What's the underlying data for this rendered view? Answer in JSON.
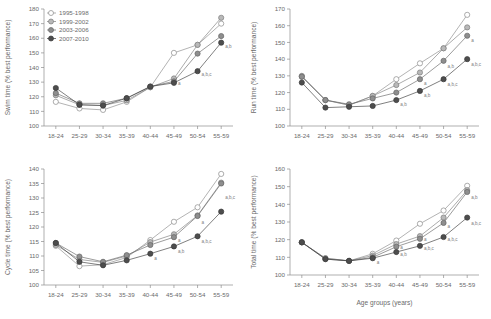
{
  "figure": {
    "legend": {
      "entries": [
        {
          "label": "1995-1998",
          "marker": "open-circle",
          "color": "#ffffff",
          "stroke": "#8a8a8a"
        },
        {
          "label": "1999-2002",
          "marker": "filled-circle",
          "color": "#b9b9b9",
          "stroke": "#7d7d7d"
        },
        {
          "label": "2003-2006",
          "marker": "filled-circle",
          "color": "#8e8e8e",
          "stroke": "#666666"
        },
        {
          "label": "2007-2010",
          "marker": "filled-circle",
          "color": "#4d4d4d",
          "stroke": "#3b3b3b"
        }
      ]
    },
    "xlabel_shared": "Age groups (years)"
  },
  "chart_data": [
    {
      "type": "line",
      "panel": "top-left",
      "title": "",
      "ylabel": "Swim time (% best performance)",
      "xlabel": "",
      "categories": [
        "18-24",
        "25-29",
        "30-34",
        "35-39",
        "40-44",
        "45-49",
        "50-54",
        "55-59"
      ],
      "ylim": [
        100,
        180
      ],
      "yticks": [
        100,
        110,
        120,
        130,
        140,
        150,
        160,
        170,
        180
      ],
      "grid": false,
      "legend_position": "top-left",
      "series": [
        {
          "name": "1995-1998",
          "values": [
            116.5,
            112.0,
            111.0,
            116.5,
            126.5,
            150.0,
            155.5,
            170.0
          ]
        },
        {
          "name": "1999-2002",
          "values": [
            121.0,
            114.5,
            114.0,
            117.5,
            126.5,
            132.5,
            155.5,
            174.0
          ]
        },
        {
          "name": "2003-2006",
          "values": [
            122.5,
            115.5,
            115.5,
            119.0,
            127.0,
            130.5,
            149.5,
            161.5
          ]
        },
        {
          "name": "2007-2010",
          "values": [
            126.0,
            114.5,
            114.0,
            119.0,
            127.0,
            129.5,
            137.5,
            157.0
          ]
        }
      ],
      "annotations": [
        {
          "x": "45-49",
          "y": 128.0,
          "text": "a"
        },
        {
          "x": "50-54",
          "y": 134.0,
          "text": "a,b,c"
        },
        {
          "x": "55-59",
          "y": 153.0,
          "text": "a,b"
        }
      ]
    },
    {
      "type": "line",
      "panel": "top-right",
      "title": "",
      "ylabel": "Run time (% best performance)",
      "xlabel": "",
      "categories": [
        "18-24",
        "25-29",
        "30-34",
        "35-39",
        "40-44",
        "45-49",
        "50-54",
        "55-59"
      ],
      "ylim": [
        100,
        170
      ],
      "yticks": [
        100,
        110,
        120,
        130,
        140,
        150,
        160,
        170
      ],
      "grid": false,
      "legend_position": "none",
      "series": [
        {
          "name": "1995-1998",
          "values": [
            129.5,
            115.5,
            112.5,
            118.0,
            128.0,
            137.5,
            146.5,
            166.5
          ]
        },
        {
          "name": "1999-2002",
          "values": [
            130.0,
            115.5,
            112.5,
            118.0,
            124.5,
            132.0,
            146.5,
            159.0
          ]
        },
        {
          "name": "2003-2006",
          "values": [
            129.5,
            115.5,
            113.0,
            116.5,
            120.0,
            128.0,
            139.0,
            154.0
          ]
        },
        {
          "name": "2007-2010",
          "values": [
            126.0,
            111.0,
            111.5,
            112.0,
            115.5,
            121.0,
            128.0,
            140.0
          ]
        }
      ],
      "annotations": [
        {
          "x": "40-44",
          "y": 112.0,
          "text": "a,b"
        },
        {
          "x": "45-49",
          "y": 117.5,
          "text": "a,b"
        },
        {
          "x": "45-49",
          "y": 124.5,
          "text": "a"
        },
        {
          "x": "50-54",
          "y": 124.0,
          "text": "a,b,c"
        },
        {
          "x": "50-54",
          "y": 135.0,
          "text": "a,b"
        },
        {
          "x": "55-59",
          "y": 136.0,
          "text": "a,b,c"
        },
        {
          "x": "55-59",
          "y": 150.0,
          "text": "a"
        }
      ]
    },
    {
      "type": "line",
      "panel": "bottom-left",
      "title": "",
      "ylabel": "Cycle time (% best performance)",
      "xlabel": "",
      "categories": [
        "18-24",
        "25-29",
        "30-34",
        "35-39",
        "40-44",
        "45-49",
        "50-54",
        "55-59"
      ],
      "ylim": [
        100,
        140
      ],
      "yticks": [
        100,
        105,
        110,
        115,
        120,
        125,
        130,
        135,
        140
      ],
      "grid": false,
      "legend_position": "none",
      "series": [
        {
          "name": "1995-1998",
          "values": [
            113.5,
            106.5,
            107.0,
            109.5,
            115.5,
            121.8,
            126.8,
            138.3
          ]
        },
        {
          "name": "1999-2002",
          "values": [
            113.8,
            108.8,
            107.8,
            110.0,
            114.8,
            117.5,
            124.0,
            135.3
          ]
        },
        {
          "name": "2003-2006",
          "values": [
            114.5,
            109.8,
            108.0,
            110.3,
            113.8,
            116.5,
            123.8,
            135.0
          ]
        },
        {
          "name": "2007-2010",
          "values": [
            114.5,
            108.0,
            106.8,
            108.5,
            110.8,
            113.3,
            116.8,
            125.3
          ]
        }
      ],
      "annotations": [
        {
          "x": "40-44",
          "y": 108.5,
          "text": "a"
        },
        {
          "x": "45-49",
          "y": 111.0,
          "text": "a,b"
        },
        {
          "x": "45-49",
          "y": 115.0,
          "text": "a"
        },
        {
          "x": "50-54",
          "y": 114.5,
          "text": "a,b,c"
        },
        {
          "x": "50-54",
          "y": 121.0,
          "text": "a"
        },
        {
          "x": "55-59",
          "y": 129.5,
          "text": "a,b,c"
        }
      ]
    },
    {
      "type": "line",
      "panel": "bottom-right",
      "title": "",
      "ylabel": "Total time (% best performance)",
      "xlabel": "Age groups (years)",
      "categories": [
        "18-24",
        "25-29",
        "30-34",
        "35-39",
        "40-44",
        "45-49",
        "50-54",
        "55-59"
      ],
      "ylim": [
        100,
        160
      ],
      "yticks": [
        100,
        110,
        120,
        130,
        140,
        150,
        160
      ],
      "grid": false,
      "legend_position": "none",
      "series": [
        {
          "name": "1995-1998",
          "values": [
            118.5,
            109.5,
            108.0,
            112.0,
            119.5,
            129.0,
            136.5,
            150.5
          ]
        },
        {
          "name": "1999-2002",
          "values": [
            118.5,
            109.5,
            108.0,
            111.0,
            117.5,
            122.0,
            132.5,
            148.0
          ]
        },
        {
          "name": "2003-2006",
          "values": [
            118.5,
            109.0,
            108.0,
            110.0,
            116.0,
            120.5,
            129.5,
            147.0
          ]
        },
        {
          "name": "2007-2010",
          "values": [
            118.5,
            109.0,
            108.0,
            109.5,
            113.0,
            116.5,
            121.5,
            132.5
          ]
        }
      ],
      "annotations": [
        {
          "x": "35-39",
          "y": 106.5,
          "text": "a"
        },
        {
          "x": "40-44",
          "y": 110.5,
          "text": "a,b"
        },
        {
          "x": "40-44",
          "y": 114.5,
          "text": "a"
        },
        {
          "x": "45-49",
          "y": 114.0,
          "text": "a,b,c"
        },
        {
          "x": "45-49",
          "y": 119.0,
          "text": "a"
        },
        {
          "x": "50-54",
          "y": 119.0,
          "text": "a,b,c"
        },
        {
          "x": "50-54",
          "y": 126.5,
          "text": "a"
        },
        {
          "x": "55-59",
          "y": 128.5,
          "text": "a,b,c"
        },
        {
          "x": "55-59",
          "y": 143.0,
          "text": "a,b"
        }
      ]
    }
  ]
}
